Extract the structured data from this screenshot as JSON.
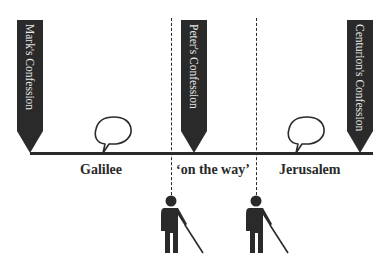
{
  "diagram": {
    "markers": [
      {
        "label": "Mark's Confession"
      },
      {
        "label": "Peter's Confession"
      },
      {
        "label": "Centurion's Confession"
      }
    ],
    "regions": [
      {
        "label": "Galilee"
      },
      {
        "label": "‘on the way’"
      },
      {
        "label": "Jerusalem"
      }
    ],
    "icons": {
      "speech_bubbles": 2,
      "blind_figures": 2
    },
    "colors": {
      "ink": "#2a2a2a",
      "marker_text": "#e8e8e8",
      "background": "#ffffff"
    }
  }
}
